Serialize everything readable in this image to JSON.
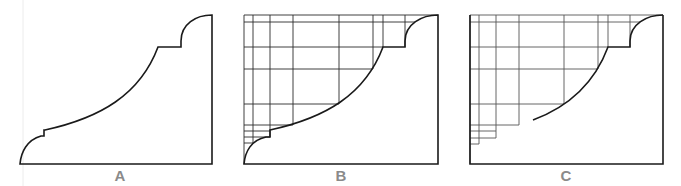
{
  "figure": {
    "panels": [
      {
        "id": "A",
        "label": "A",
        "stage": "profile outline"
      },
      {
        "id": "B",
        "label": "B",
        "stage": "profile with construction grid"
      },
      {
        "id": "C",
        "label": "C",
        "stage": "grid with partial curve"
      }
    ]
  }
}
